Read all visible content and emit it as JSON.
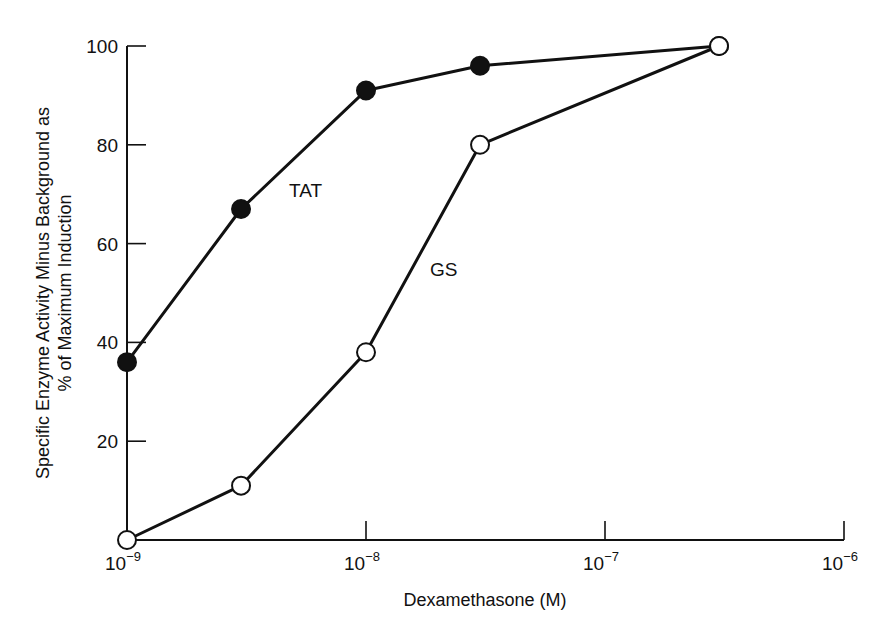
{
  "chart_data": {
    "type": "line",
    "title": "",
    "xlabel": "Dexamethasone (M)",
    "ylabel_lines": [
      "Specific Enzyme Activity Minus Background as",
      "% of Maximum Induction"
    ],
    "ylabel": "Specific Enzyme Activity Minus Background as % of Maximum Induction",
    "x_scale": "log",
    "x_ticks": [
      {
        "base": "10",
        "exp": "−9",
        "value": 1e-09
      },
      {
        "base": "10",
        "exp": "−8",
        "value": 1e-08
      },
      {
        "base": "10",
        "exp": "−7",
        "value": 1e-07
      },
      {
        "base": "10",
        "exp": "−6",
        "value": 1e-06
      }
    ],
    "y_ticks": [
      "20",
      "40",
      "60",
      "80",
      "100"
    ],
    "xlim": [
      1e-09,
      1e-06
    ],
    "ylim": [
      0,
      100
    ],
    "grid": false,
    "legend": "inline labels",
    "x": [
      1e-09,
      3e-09,
      1e-08,
      3e-08,
      3e-07
    ],
    "series": [
      {
        "name": "TAT",
        "marker": "filled-circle",
        "values": [
          36,
          67,
          91,
          96,
          100
        ]
      },
      {
        "name": "GS",
        "marker": "open-circle",
        "values": [
          0,
          11,
          38,
          80,
          100
        ]
      }
    ],
    "annotations": [
      {
        "text": "TAT",
        "near_series": "TAT"
      },
      {
        "text": "GS",
        "near_series": "GS"
      }
    ]
  },
  "colors": {
    "ink": "#111111",
    "background": "#ffffff"
  }
}
